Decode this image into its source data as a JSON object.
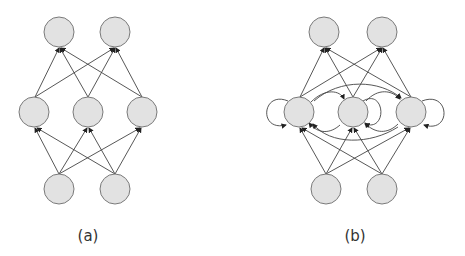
{
  "figures": [
    {
      "id": "a",
      "caption": "(a)",
      "description": "Feedforward neural network: 2 input, 3 hidden, 2 output nodes"
    },
    {
      "id": "b",
      "caption": "(b)",
      "description": "Recurrent neural network: 2 input, 3 hidden with recurrent and self connections, 2 output nodes"
    }
  ],
  "colors": {
    "node_fill": "#e2e2e2",
    "node_stroke": "#7a7a7a",
    "edge": "#444444"
  }
}
